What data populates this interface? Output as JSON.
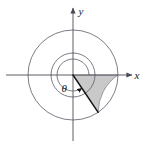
{
  "figure": {
    "caption": "Polar diagram: angle theta in standard position with shaded annular-free sector",
    "background_color": "#ffffff",
    "stroke_color": "#5a5a66",
    "axis_color": "#4a4a55",
    "ray_color": "#1a1a1a",
    "shade_fill": "#c9c9c9",
    "shade_stroke": "#7a7a84",
    "label_color": "#1a1a1a"
  },
  "geometry": {
    "center_x": 73,
    "center_y": 75,
    "inner_radius": 22,
    "outer_radius": 45,
    "arc_radius": 16,
    "ray_angle_deg": -56,
    "sector_start_deg": 0,
    "sector_end_deg": -56,
    "theta_sweep_deg": 304
  },
  "labels": {
    "x_axis": "x",
    "y_axis": "y",
    "angle": "θ"
  },
  "axes": {
    "x_left": 6,
    "x_right": 132,
    "y_top": 8,
    "y_bottom": 141
  }
}
